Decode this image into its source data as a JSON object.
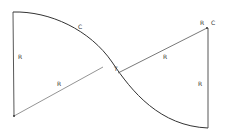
{
  "diagram": {
    "type": "reverse-curve geometry",
    "colors": {
      "stroke": "#333333",
      "radius_line": "#555555",
      "background": "#ffffff"
    },
    "labels": {
      "upper_curve": "C",
      "left_vertical_radius": "R",
      "left_diagonal_radius": "R",
      "tangent_point": "T",
      "right_diagonal_radius": "R",
      "right_corner_r": "R",
      "right_corner_c": "C",
      "right_vertical_radius": "R"
    }
  }
}
